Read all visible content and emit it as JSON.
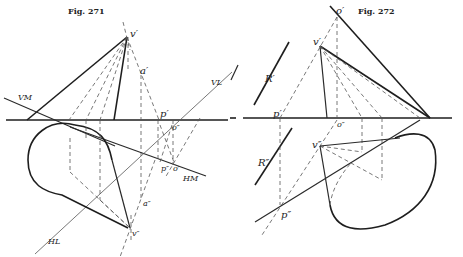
{
  "figures": [
    {
      "title": "Fig. 271",
      "labels": {
        "v_prime": "v′",
        "a_prime": "a′",
        "VL": "VL",
        "VM": "VM",
        "p_prime": "p′",
        "o_dprime_top": "o″",
        "p_dprime": "p″",
        "o_prime": "o′",
        "HM": "HM",
        "a_dprime": "a″",
        "v_dprime": "v″",
        "HL": "HL"
      }
    },
    {
      "title": "Fig. 272",
      "labels": {
        "o_prime": "o′",
        "v_prime": "v′",
        "R_prime": "R′",
        "p_prime": "p′",
        "o_dprime": "o″",
        "R_dprime": "R″",
        "v_dprime": "v″",
        "p_dprime": "p″"
      }
    }
  ]
}
